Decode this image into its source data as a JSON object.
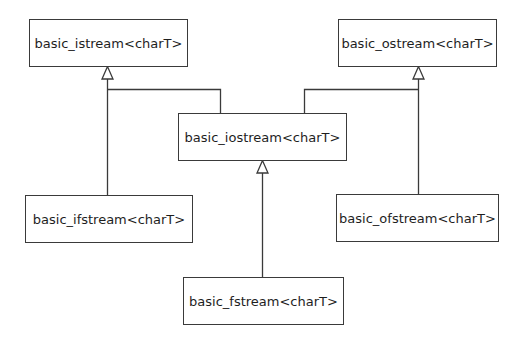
{
  "diagram": {
    "type": "class-inheritance",
    "colors": {
      "line": "#3a3a3a",
      "text": "#1e1e1e",
      "background": "#ffffff"
    },
    "nodes": [
      {
        "id": "istream",
        "label": "basic_istream<charT>"
      },
      {
        "id": "ostream",
        "label": "basic_ostream<charT>"
      },
      {
        "id": "iostream",
        "label": "basic_iostream<charT>"
      },
      {
        "id": "ifstream",
        "label": "basic_ifstream<charT>"
      },
      {
        "id": "ofstream",
        "label": "basic_ofstream<charT>"
      },
      {
        "id": "fstream",
        "label": "basic_fstream<charT>"
      }
    ],
    "edges": [
      {
        "from": "iostream",
        "to": "istream",
        "kind": "inherits"
      },
      {
        "from": "iostream",
        "to": "ostream",
        "kind": "inherits"
      },
      {
        "from": "ifstream",
        "to": "istream",
        "kind": "inherits"
      },
      {
        "from": "ofstream",
        "to": "ostream",
        "kind": "inherits"
      },
      {
        "from": "fstream",
        "to": "iostream",
        "kind": "inherits"
      }
    ]
  }
}
